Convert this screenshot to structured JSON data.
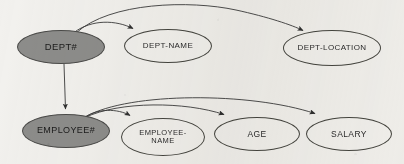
{
  "diagram": {
    "background_color": "#f2f1ee",
    "key_fill_color": "#8d8d8b",
    "stroke_color": "#3a3a3a",
    "nodes": [
      {
        "id": "dept-number",
        "label": "DEPT#",
        "kind": "key",
        "cx": 61,
        "cy": 47,
        "rx": 44,
        "ry": 17,
        "font_size": 9.5
      },
      {
        "id": "dept-name",
        "label": "DEPT-NAME",
        "kind": "attribute",
        "cx": 168,
        "cy": 46,
        "rx": 44,
        "ry": 17,
        "font_size": 8
      },
      {
        "id": "dept-location",
        "label": "DEPT-LOCATION",
        "kind": "attribute",
        "cx": 332,
        "cy": 48,
        "rx": 49,
        "ry": 18,
        "font_size": 8
      },
      {
        "id": "employee-number",
        "label": "EMPLOYEE#",
        "kind": "key",
        "cx": 66,
        "cy": 131,
        "rx": 44,
        "ry": 17,
        "font_size": 9
      },
      {
        "id": "employee-name",
        "label": "EMPLOYEE-\nNAME",
        "kind": "attribute",
        "cx": 163,
        "cy": 137,
        "rx": 42,
        "ry": 19,
        "font_size": 7.5
      },
      {
        "id": "age",
        "label": "AGE",
        "kind": "attribute",
        "cx": 257,
        "cy": 134,
        "rx": 43,
        "ry": 17,
        "font_size": 8.5
      },
      {
        "id": "salary",
        "label": "SALARY",
        "kind": "attribute",
        "cx": 349,
        "cy": 134,
        "rx": 43,
        "ry": 17,
        "font_size": 8.5
      }
    ],
    "edges": [
      {
        "id": "dept-to-dept-name",
        "from": "dept-number",
        "to": "dept-name",
        "style": "curved-arrow"
      },
      {
        "id": "dept-to-dept-location",
        "from": "dept-number",
        "to": "dept-location",
        "style": "curved-arrow"
      },
      {
        "id": "dept-to-employee",
        "from": "dept-number",
        "to": "employee-number",
        "style": "straight-arrow"
      },
      {
        "id": "employee-to-employee-name",
        "from": "employee-number",
        "to": "employee-name",
        "style": "curved-arrow"
      },
      {
        "id": "employee-to-age",
        "from": "employee-number",
        "to": "age",
        "style": "curved-arrow"
      },
      {
        "id": "employee-to-salary",
        "from": "employee-number",
        "to": "salary",
        "style": "curved-arrow"
      }
    ]
  }
}
